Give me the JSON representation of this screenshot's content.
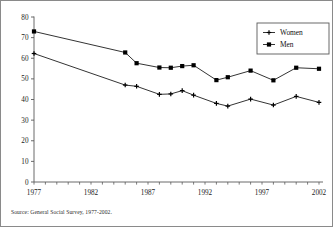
{
  "figure": {
    "source_note": "Source:  General Social Survey, 1977-2002."
  },
  "legend": {
    "position": "top-right",
    "entries": [
      {
        "label": "Women",
        "marker": "plus-marker-icon",
        "color": "#000000"
      },
      {
        "label": "Men",
        "marker": "square-marker-icon",
        "color": "#000000"
      }
    ]
  },
  "axes": {
    "y_ticks": [
      "0",
      "10",
      "20",
      "30",
      "40",
      "50",
      "60",
      "70",
      "80"
    ],
    "x_ticks": [
      "1977",
      "1982",
      "1987",
      "1992",
      "1997",
      "2002"
    ]
  },
  "chart_data": {
    "type": "line",
    "title": "",
    "xlabel": "",
    "ylabel": "",
    "xlim": [
      1977,
      2002
    ],
    "ylim": [
      0,
      80
    ],
    "y_tick_step": 10,
    "x_tick_step": 5,
    "grid": false,
    "legend_position": "top-right",
    "x": [
      1977,
      1985,
      1986,
      1988,
      1989,
      1990,
      1991,
      1993,
      1994,
      1996,
      1998,
      2000,
      2002
    ],
    "series": [
      {
        "name": "Men",
        "marker": "square",
        "color": "#000000",
        "values": [
          73.0,
          62.8,
          57.6,
          55.5,
          55.4,
          56.2,
          56.6,
          49.4,
          50.8,
          54.0,
          49.3,
          55.4,
          54.9
        ]
      },
      {
        "name": "Women",
        "marker": "plus",
        "color": "#000000",
        "values": [
          62.3,
          47.0,
          46.4,
          42.5,
          42.7,
          44.3,
          42.1,
          38.1,
          36.8,
          40.2,
          37.3,
          41.5,
          38.6
        ]
      }
    ]
  }
}
